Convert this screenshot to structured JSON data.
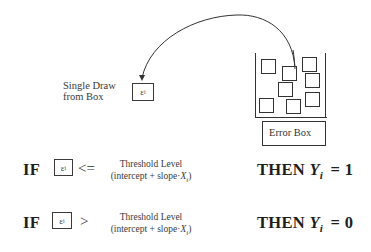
{
  "diagram": {
    "draw_label": {
      "line1": "Single Draw",
      "line2": "from Box"
    },
    "epsilon_symbol": "ε",
    "epsilon_subscript": "i",
    "error_box_label": "Error Box",
    "error_box_items_count": 8,
    "arrow": "curved arrow from Error Box to single draw"
  },
  "rules": [
    {
      "if_label": "IF",
      "operator": "<=",
      "threshold_line1": "Threshold Level",
      "threshold_line2_prefix": "(intercept + slope·",
      "threshold_var": "X",
      "threshold_var_sub": "i",
      "threshold_line2_suffix": ")",
      "then_label": "THEN",
      "result_var": "Y",
      "result_var_sub": "i",
      "result_eq": "= 1"
    },
    {
      "if_label": "IF",
      "operator": ">",
      "threshold_line1": "Threshold Level",
      "threshold_line2_prefix": "(intercept + slope·",
      "threshold_var": "X",
      "threshold_var_sub": "i",
      "threshold_line2_suffix": ")",
      "then_label": "THEN",
      "result_var": "Y",
      "result_var_sub": "i",
      "result_eq": "= 0"
    }
  ],
  "colors": {
    "ink": "#2a2a2a",
    "background": "#ffffff"
  }
}
